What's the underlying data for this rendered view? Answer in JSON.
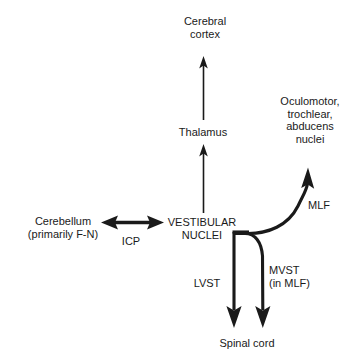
{
  "diagram": {
    "background_color": "#ffffff",
    "stroke_color": "#1a1a1a",
    "nodes": [
      {
        "id": "cerebral-cortex",
        "label": "Cerebral\ncortex",
        "x": 205,
        "y": 22
      },
      {
        "id": "thalamus",
        "label": "Thalamus",
        "x": 203,
        "y": 132
      },
      {
        "id": "oculomotor-nuclei",
        "label": "Oculomotor,\ntrochlear,\nabducens\nnuclei",
        "x": 310,
        "y": 107
      },
      {
        "id": "cerebellum",
        "label": "Cerebellum\n(primarily F-N)",
        "x": 63,
        "y": 221
      },
      {
        "id": "vestibular-nuclei",
        "label": "VESTIBULAR\nNUCLEI",
        "x": 202,
        "y": 222
      },
      {
        "id": "spinal-cord",
        "label": "Spinal cord",
        "x": 247,
        "y": 343
      }
    ],
    "pathway_labels": [
      {
        "id": "icp",
        "label": "ICP",
        "x": 131,
        "y": 241
      },
      {
        "id": "mlf",
        "label": "MLF",
        "x": 319,
        "y": 205
      },
      {
        "id": "lvst",
        "label": "LVST",
        "x": 207,
        "y": 283
      },
      {
        "id": "mvst",
        "label": "MVST\n(in MLF)",
        "x": 269,
        "y": 270
      }
    ],
    "connections": [
      {
        "id": "thalamus-to-cortex",
        "from": "thalamus",
        "to": "cerebral-cortex",
        "style": "thin-arrow",
        "direction": "up"
      },
      {
        "id": "vestibular-to-thalamus",
        "from": "vestibular-nuclei",
        "to": "thalamus",
        "style": "thin-arrow",
        "direction": "up"
      },
      {
        "id": "vestibular-to-oculomotor",
        "from": "vestibular-nuclei",
        "to": "oculomotor-nuclei",
        "style": "thick-curved-arrow",
        "pathway": "MLF"
      },
      {
        "id": "cerebellum-vestibular",
        "from": "cerebellum",
        "to": "vestibular-nuclei",
        "style": "thick-double-arrow",
        "pathway": "ICP"
      },
      {
        "id": "vestibular-to-spinal-lvst",
        "from": "vestibular-nuclei",
        "to": "spinal-cord",
        "style": "thick-arrow",
        "pathway": "LVST"
      },
      {
        "id": "vestibular-to-spinal-mvst",
        "from": "vestibular-nuclei",
        "to": "spinal-cord",
        "style": "thick-curved-arrow",
        "pathway": "MVST (in MLF)"
      }
    ]
  }
}
